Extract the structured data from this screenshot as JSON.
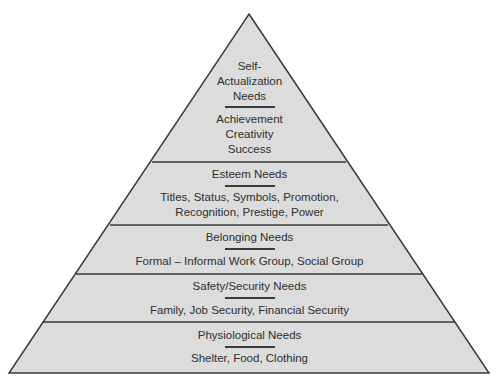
{
  "diagram": {
    "type": "pyramid",
    "colors": {
      "fill": "#dcdcdc",
      "stroke": "#3a3a3a",
      "text": "#2e2e2e",
      "background": "#ffffff"
    },
    "levels": [
      {
        "title_lines": [
          "Self-",
          "Actualization",
          "Needs"
        ],
        "detail_lines": [
          "Achievement",
          "Creativity",
          "Success"
        ]
      },
      {
        "title_lines": [
          "Esteem Needs"
        ],
        "detail_lines": [
          "Titles, Status, Symbols, Promotion,",
          "Recognition, Prestige, Power"
        ]
      },
      {
        "title_lines": [
          "Belonging Needs"
        ],
        "detail_lines": [
          "Formal – Informal Work Group, Social Group"
        ]
      },
      {
        "title_lines": [
          "Safety/Security Needs"
        ],
        "detail_lines": [
          "Family, Job Security, Financial Security"
        ]
      },
      {
        "title_lines": [
          "Physiological Needs"
        ],
        "detail_lines": [
          "Shelter, Food, Clothing"
        ]
      }
    ]
  }
}
